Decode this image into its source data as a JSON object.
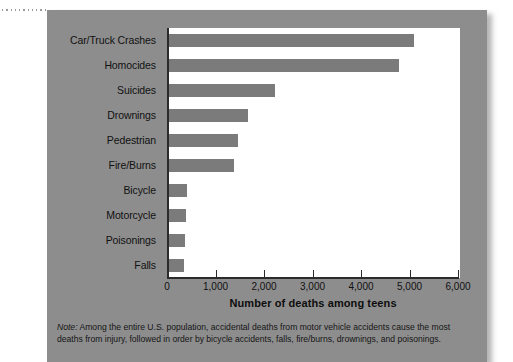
{
  "chart_data": {
    "type": "bar",
    "orientation": "horizontal",
    "title": "",
    "xlabel": "Number of deaths among teens",
    "ylabel": "",
    "xlim": [
      0,
      6000
    ],
    "xticks": [
      0,
      1000,
      2000,
      3000,
      4000,
      5000,
      6000
    ],
    "xtick_labels": [
      "0",
      "1,000",
      "2,000",
      "3,000",
      "4,000",
      "5,000",
      "6,000"
    ],
    "grid": false,
    "legend": null,
    "bar_color": "#7b7b7b",
    "plot_background": "#ffffff",
    "panel_background": "#8d8d8d",
    "categories": [
      "Car/Truck Crashes",
      "Homocides",
      "Suicides",
      "Drownings",
      "Pedestrian",
      "Fire/Burns",
      "Bicycle",
      "Motorcycle",
      "Poisonings",
      "Falls"
    ],
    "values": [
      5050,
      4750,
      2180,
      1620,
      1420,
      1340,
      370,
      350,
      330,
      310
    ]
  },
  "note": {
    "label": "Note:",
    "text": " Among the entire U.S. population, accidental deaths from motor vehicle accidents cause the most deaths from injury, followed in order by bicycle accidents, falls, fire/burns, drownings, and poisonings."
  }
}
